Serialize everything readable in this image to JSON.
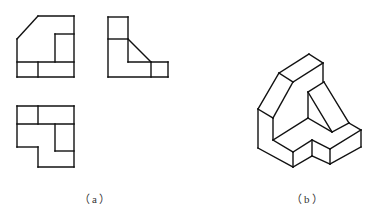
{
  "figure": {
    "stroke_color": "#111111",
    "background": "#ffffff",
    "panels": [
      {
        "id": "a",
        "label": "（a）",
        "content": "Three orthographic views",
        "views": [
          {
            "name": "front-view",
            "lines": [
              [
                38,
                16,
                74,
                16
              ],
              [
                38,
                16,
                17,
                39
              ],
              [
                17,
                39,
                17,
                77
              ],
              [
                74,
                16,
                74,
                77
              ],
              [
                17,
                77,
                74,
                77
              ],
              [
                17,
                62,
                74,
                62
              ],
              [
                38,
                62,
                38,
                77
              ],
              [
                55,
                34,
                74,
                34
              ],
              [
                55,
                34,
                55,
                62
              ]
            ]
          },
          {
            "name": "side-view",
            "lines": [
              [
                108,
                17,
                128,
                17
              ],
              [
                108,
                17,
                108,
                77
              ],
              [
                128,
                17,
                128,
                62
              ],
              [
                108,
                39,
                128,
                39
              ],
              [
                128,
                39,
                151,
                62
              ],
              [
                128,
                62,
                168,
                62
              ],
              [
                168,
                62,
                168,
                77
              ],
              [
                151,
                62,
                151,
                77
              ],
              [
                108,
                77,
                168,
                77
              ]
            ]
          },
          {
            "name": "top-view",
            "lines": [
              [
                17,
                106,
                74,
                106
              ],
              [
                17,
                106,
                17,
                147
              ],
              [
                17,
                147,
                38,
                147
              ],
              [
                38,
                147,
                38,
                167
              ],
              [
                38,
                167,
                74,
                167
              ],
              [
                74,
                106,
                74,
                167
              ],
              [
                17,
                124,
                74,
                124
              ],
              [
                38,
                106,
                38,
                124
              ],
              [
                55,
                124,
                55,
                151
              ],
              [
                55,
                151,
                74,
                151
              ]
            ]
          }
        ]
      },
      {
        "id": "b",
        "label": "（b）",
        "content": "Isometric view",
        "views": [
          {
            "name": "isometric-view",
            "lines": [
              [
                279,
                73,
                309,
                54
              ],
              [
                309,
                54,
                323,
                63
              ],
              [
                279,
                73,
                293,
                82
              ],
              [
                293,
                82,
                323,
                63
              ],
              [
                323,
                63,
                323,
                82
              ],
              [
                279,
                73,
                258,
                109
              ],
              [
                293,
                82,
                273,
                118
              ],
              [
                258,
                109,
                273,
                118
              ],
              [
                258,
                109,
                258,
                148
              ],
              [
                273,
                118,
                273,
                140
              ],
              [
                258,
                148,
                293,
                167
              ],
              [
                273,
                140,
                293,
                152
              ],
              [
                293,
                152,
                293,
                167
              ],
              [
                273,
                140,
                308,
                118
              ],
              [
                324,
                82,
                308,
                92
              ],
              [
                308,
                92,
                308,
                118
              ],
              [
                308,
                92,
                332,
                132
              ],
              [
                308,
                118,
                332,
                132
              ],
              [
                324,
                82,
                349,
                123
              ],
              [
                349,
                123,
                361,
                130
              ],
              [
                332,
                132,
                349,
                123
              ],
              [
                361,
                130,
                330,
                149
              ],
              [
                361,
                130,
                361,
                147
              ],
              [
                361,
                147,
                330,
                164
              ],
              [
                293,
                152,
                312,
                140
              ],
              [
                293,
                167,
                312,
                156
              ],
              [
                312,
                140,
                312,
                156
              ],
              [
                312,
                140,
                330,
                149
              ],
              [
                312,
                156,
                330,
                164
              ],
              [
                330,
                149,
                330,
                164
              ]
            ]
          }
        ]
      }
    ]
  }
}
